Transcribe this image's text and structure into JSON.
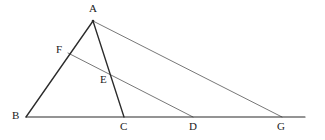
{
  "figure": {
    "type": "geometry-diagram",
    "background_color": "#ffffff",
    "stroke_color": "#2b2b2b",
    "thin_stroke_color": "#4a4a4a",
    "label_color": "#1a1a1a",
    "canvas": {
      "width": 325,
      "height": 140
    },
    "points": [
      {
        "id": "A",
        "label": "A",
        "x": 93,
        "y": 21,
        "label_x": 89,
        "label_y": 3
      },
      {
        "id": "B",
        "label": "B",
        "x": 26,
        "y": 117,
        "label_x": 12,
        "label_y": 112
      },
      {
        "id": "C",
        "label": "C",
        "x": 124,
        "y": 117,
        "label_x": 120,
        "label_y": 121
      },
      {
        "id": "D",
        "label": "D",
        "x": 193,
        "y": 117,
        "label_x": 189,
        "label_y": 121
      },
      {
        "id": "G",
        "label": "G",
        "x": 282,
        "y": 117,
        "label_x": 277,
        "label_y": 121
      },
      {
        "id": "F",
        "label": "F",
        "x": 68,
        "y": 53,
        "label_x": 56,
        "label_y": 44
      },
      {
        "id": "E",
        "label": "E",
        "x": 110,
        "y": 70,
        "label_x": 100,
        "label_y": 74
      }
    ],
    "segments": [
      {
        "id": "AB",
        "from": "A",
        "to": "B",
        "style": "solid",
        "weight": "bold",
        "x1": 93,
        "y1": 21,
        "x2": 26,
        "y2": 117
      },
      {
        "id": "AC",
        "from": "A",
        "to": "C",
        "style": "solid",
        "weight": "bold",
        "x1": 93,
        "y1": 21,
        "x2": 124,
        "y2": 117
      },
      {
        "id": "baseline",
        "from": "B",
        "to": "base-end",
        "style": "solid",
        "weight": "bold",
        "x1": 26,
        "y1": 117,
        "x2": 305,
        "y2": 117
      },
      {
        "id": "AG",
        "from": "A",
        "to": "G",
        "style": "thin",
        "weight": "light",
        "x1": 93,
        "y1": 21,
        "x2": 282,
        "y2": 117
      },
      {
        "id": "FD",
        "from": "F",
        "to": "D",
        "style": "thin",
        "weight": "light",
        "x1": 68,
        "y1": 53,
        "x2": 193,
        "y2": 117
      }
    ]
  }
}
